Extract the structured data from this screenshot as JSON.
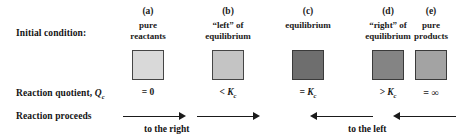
{
  "figure": {
    "row_labels": {
      "initial_condition": "Initial condition:",
      "reaction_quotient_prefix": "Reaction quotient, ",
      "reaction_quotient_symbol": "Q",
      "reaction_quotient_subscript": "c",
      "reaction_proceeds": "Reaction proceeds"
    },
    "columns": [
      {
        "letter": "(a)",
        "caption_line1": "pure",
        "caption_line2": "reactants",
        "swatch_color": "#d9d9d9",
        "swatch_border": "#454545",
        "qc_relation": "= 0",
        "qc_subscript": ""
      },
      {
        "letter": "(b)",
        "caption_line1": "“left” of",
        "caption_line2": "equilibrium",
        "swatch_color": "#c4c4c4",
        "swatch_border": "#454545",
        "qc_relation": "< K",
        "qc_subscript": "c"
      },
      {
        "letter": "(c)",
        "caption_line1": "equilibrium",
        "caption_line2": "",
        "swatch_color": "#6e6e6e",
        "swatch_border": "#3a3a3a",
        "qc_relation": "= K",
        "qc_subscript": "c"
      },
      {
        "letter": "(d)",
        "caption_line1": "“right” of",
        "caption_line2": "equilibrium",
        "swatch_color": "#848484",
        "swatch_border": "#3a3a3a",
        "qc_relation": "> K",
        "qc_subscript": "c"
      },
      {
        "letter": "(e)",
        "caption_line1": "pure",
        "caption_line2": "products",
        "swatch_color": "#a3a3a3",
        "swatch_border": "#3a3a3a",
        "qc_relation": "= ∞",
        "qc_subscript": ""
      }
    ],
    "directions": {
      "right_text": "to the right",
      "left_text": "to the left"
    },
    "colors": {
      "ink": "#1a1a1a",
      "background": "#ffffff"
    }
  }
}
